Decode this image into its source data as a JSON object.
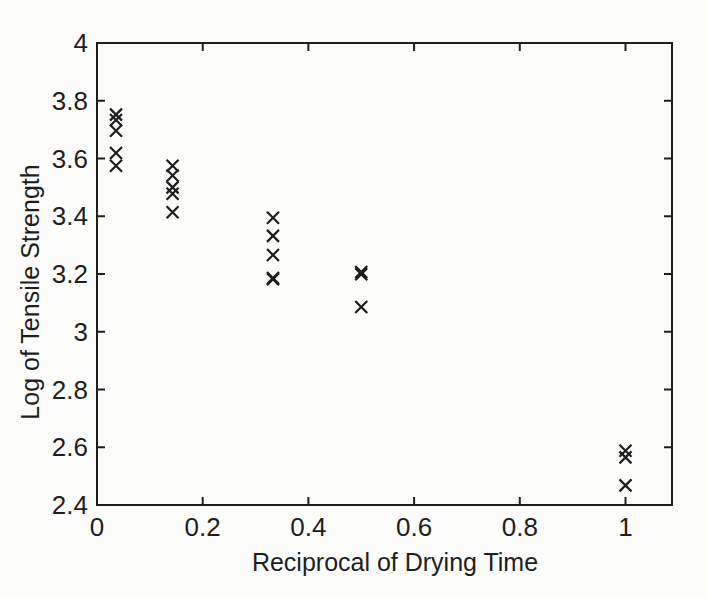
{
  "figure": {
    "background_color": "#fcfcfb",
    "ink_color": "#1e1e1e"
  },
  "chart_data": {
    "type": "scatter",
    "title": "",
    "xlabel": "Reciprocal of Drying Time",
    "ylabel": "Log of Tensile Strength",
    "marker": "x",
    "marker_color": "#1e1e1e",
    "grid": false,
    "legend": "none",
    "xlim": [
      0,
      1.088
    ],
    "ylim": [
      2.4,
      4
    ],
    "x_ticks": [
      0,
      0.2,
      0.4,
      0.6,
      0.8,
      1
    ],
    "x_tick_labels": [
      "0",
      "0.2",
      "0.4",
      "0.6",
      "0.8",
      "1"
    ],
    "y_ticks": [
      2.4,
      2.6,
      2.8,
      3,
      3.2,
      3.4,
      3.6,
      3.8,
      4
    ],
    "y_tick_labels": [
      "2.4",
      "2.6",
      "2.8",
      "3",
      "3.2",
      "3.4",
      "3.6",
      "3.8",
      "4"
    ],
    "series": [
      {
        "name": "log-tensile-strength",
        "x": [
          0.036,
          0.036,
          0.036,
          0.036,
          0.036,
          0.143,
          0.143,
          0.143,
          0.143,
          0.143,
          0.333,
          0.333,
          0.333,
          0.333,
          0.333,
          0.5,
          0.5,
          0.5,
          1,
          1,
          1
        ],
        "y": [
          3.752,
          3.733,
          3.696,
          3.619,
          3.575,
          3.575,
          3.541,
          3.5,
          3.478,
          3.414,
          3.395,
          3.332,
          3.266,
          3.186,
          3.182,
          3.207,
          3.199,
          3.086,
          2.588,
          2.565,
          2.468
        ]
      }
    ]
  }
}
